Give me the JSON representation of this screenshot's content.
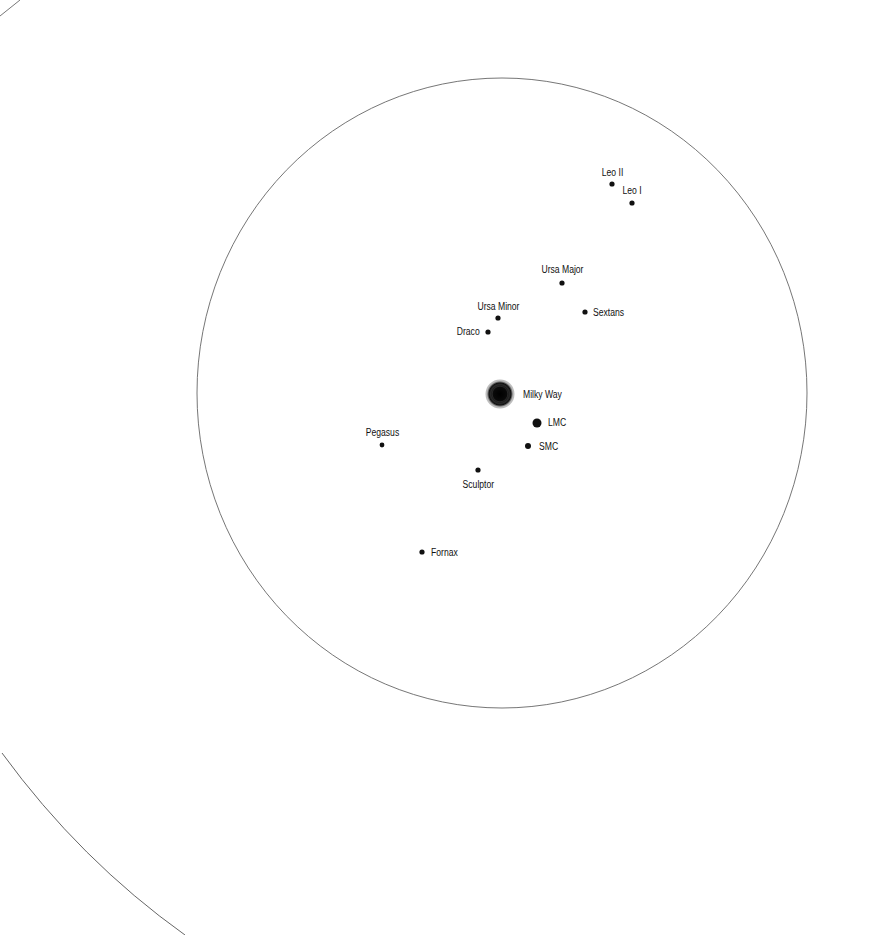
{
  "map": {
    "title": "Milky Way satellite galaxies",
    "background": "#ffffff",
    "ink_color": "#111111",
    "line_color": "#777777",
    "outer_circle": {
      "cx": 502,
      "cy": 393,
      "rx": 305,
      "ry": 315
    },
    "outer_arc_lower_left": {
      "from": [
        2,
        753
      ],
      "to": [
        185,
        935
      ]
    },
    "outer_arc_upper_left": {
      "from": [
        0,
        16
      ],
      "to": [
        20,
        0
      ]
    },
    "central_galaxy": {
      "name": "Milky Way",
      "x": 500,
      "y": 394,
      "r": 13
    }
  },
  "galaxies": [
    {
      "name": "Milky Way",
      "x": 500,
      "y": 394,
      "r": 13,
      "label_x": 523,
      "label_y": 389,
      "anchor": "left"
    },
    {
      "name": "Leo II",
      "x": 612,
      "y": 184,
      "r": 2.6,
      "label_x": 612,
      "label_y": 167,
      "anchor": "center"
    },
    {
      "name": "Leo I",
      "x": 632,
      "y": 203,
      "r": 2.6,
      "label_x": 632,
      "label_y": 185,
      "anchor": "center"
    },
    {
      "name": "Ursa Major",
      "x": 562,
      "y": 283,
      "r": 2.6,
      "label_x": 562,
      "label_y": 264,
      "anchor": "center"
    },
    {
      "name": "Sextans",
      "x": 585,
      "y": 312,
      "r": 2.6,
      "label_x": 593,
      "label_y": 307,
      "anchor": "left"
    },
    {
      "name": "Ursa Minor",
      "x": 498,
      "y": 318,
      "r": 2.6,
      "label_x": 498,
      "label_y": 301,
      "anchor": "center"
    },
    {
      "name": "Draco",
      "x": 488,
      "y": 332,
      "r": 2.6,
      "label_x": 480,
      "label_y": 326,
      "anchor": "right"
    },
    {
      "name": "LMC",
      "x": 537,
      "y": 423,
      "r": 4.5,
      "label_x": 548,
      "label_y": 417,
      "anchor": "left"
    },
    {
      "name": "SMC",
      "x": 528,
      "y": 446,
      "r": 3,
      "label_x": 539,
      "label_y": 441,
      "anchor": "left"
    },
    {
      "name": "Pegasus",
      "x": 382,
      "y": 445,
      "r": 2.4,
      "label_x": 382,
      "label_y": 427,
      "anchor": "center"
    },
    {
      "name": "Sculptor",
      "x": 478,
      "y": 470,
      "r": 2.6,
      "label_x": 478,
      "label_y": 479,
      "anchor": "center"
    },
    {
      "name": "Fornax",
      "x": 422,
      "y": 552,
      "r": 2.6,
      "label_x": 431,
      "label_y": 547,
      "anchor": "left"
    }
  ]
}
